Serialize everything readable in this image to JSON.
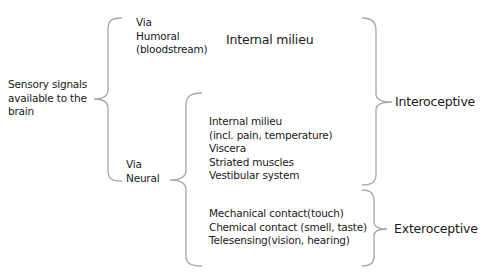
{
  "diagram": {
    "root": {
      "lines": [
        "Sensory signals",
        "available to the",
        "brain"
      ]
    },
    "humoral": {
      "lines": [
        "Via",
        "Humoral",
        "(bloodstream)"
      ],
      "target": "Internal milieu"
    },
    "neural": {
      "lines": [
        "Via",
        "Neural"
      ],
      "interoceptive_items": [
        "Internal milieu",
        "(incl. pain, temperature)",
        "Viscera",
        "Striated muscles",
        "Vestibular system"
      ],
      "exteroceptive_items": [
        "Mechanical contact(touch)",
        "Chemical contact (smell, taste)",
        "Telesensing(vision, hearing)"
      ]
    },
    "categories": {
      "interoceptive": "Interoceptive",
      "exteroceptive": "Exteroceptive"
    },
    "brace_color": "#a8a8a8"
  }
}
